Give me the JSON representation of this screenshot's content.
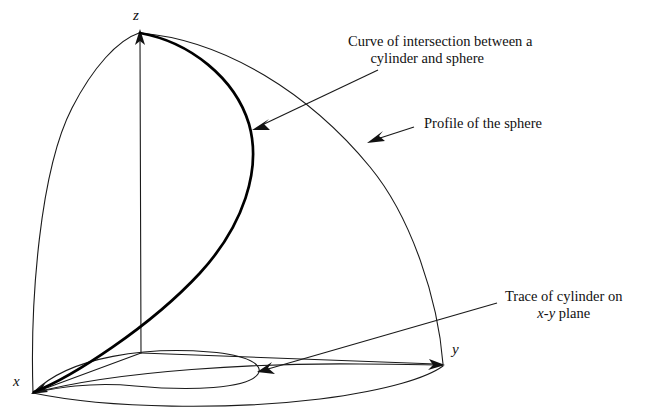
{
  "figure": {
    "background_color": "#ffffff",
    "line_color": "#1a1a1a",
    "highlight_color": "#000000"
  },
  "axes": {
    "z_label": "z",
    "y_label": "y",
    "x_label": "x"
  },
  "callouts": {
    "curve_intersection": {
      "line1": "Curve of intersection between a",
      "line2": "cylinder and sphere"
    },
    "profile_sphere": {
      "line1": "Profile of the sphere"
    },
    "trace_cylinder": {
      "line1": "Trace of cylinder on",
      "line2_pre": "x",
      "line2_dash": "-",
      "line2_mid": "y",
      "line2_post": " plane"
    }
  },
  "geometry": {
    "origin": "141,353",
    "z_tip": "140,32",
    "y_tip": "443,365",
    "x_tip": "33,393",
    "curve_arrow_tip": "253,128",
    "profile_arrow_tip": "368,142",
    "trace_arrow_tip": "258,372"
  }
}
